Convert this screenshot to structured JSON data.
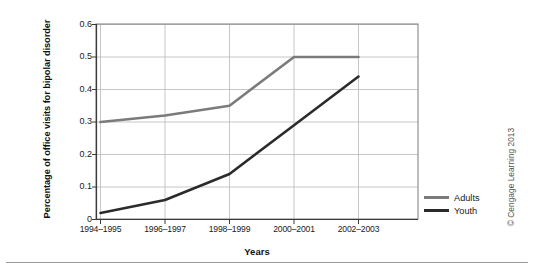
{
  "chart_data": {
    "type": "line",
    "title": "",
    "xlabel": "Years",
    "ylabel": "Percentage of office visits for bipolar disorder",
    "categories": [
      "1994–1995",
      "1996–1997",
      "1998–1999",
      "2000–2001",
      "2002–2003"
    ],
    "yticks": [
      "0",
      "0.1",
      "0.2",
      "0.3",
      "0.4",
      "0.5",
      "0.6"
    ],
    "ytick_values": [
      0,
      0.1,
      0.2,
      0.3,
      0.4,
      0.5,
      0.6
    ],
    "ylim": [
      0,
      0.6
    ],
    "grid": true,
    "legend_position": "right",
    "series": [
      {
        "name": "Adults",
        "color": "#7b7b7b",
        "values": [
          0.3,
          0.32,
          0.35,
          0.5,
          0.5
        ]
      },
      {
        "name": "Youth",
        "color": "#2b2b2b",
        "values": [
          0.02,
          0.06,
          0.14,
          0.29,
          0.44
        ]
      }
    ]
  },
  "legend": {
    "items": [
      {
        "label": "Adults",
        "color": "#7b7b7b"
      },
      {
        "label": "Youth",
        "color": "#2b2b2b"
      }
    ]
  },
  "credit": {
    "text": "© Cengage Learning 2013"
  }
}
